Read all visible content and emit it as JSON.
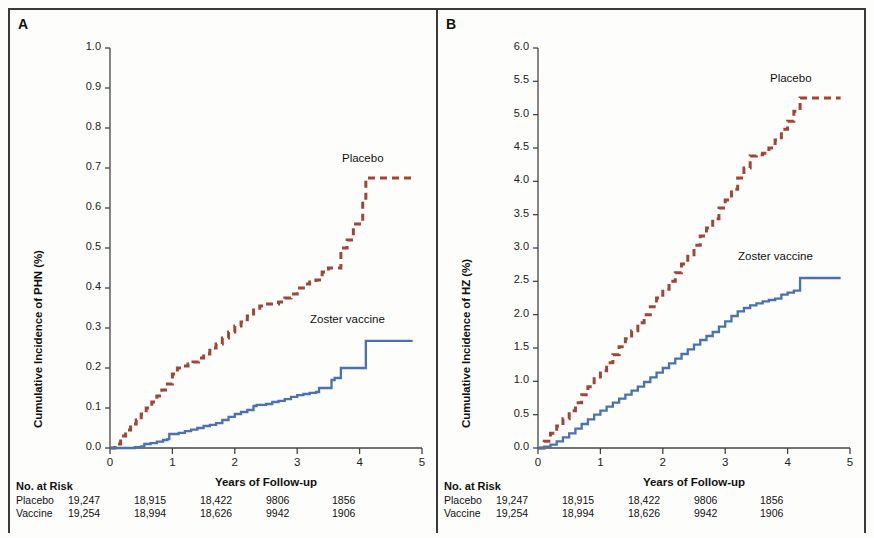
{
  "figure": {
    "background": "#fdfdfc",
    "frame_color": "#3a3a3a",
    "placebo_color": "#9e4638",
    "vaccine_color": "#4a72b0"
  },
  "panels": [
    {
      "letter": "A",
      "y_axis_title": "Cumulative Incidence of PHN (%)",
      "x_axis_title": "Years of Follow-up",
      "y_ticks": [
        "0.0",
        "0.1",
        "0.2",
        "0.3",
        "0.4",
        "0.5",
        "0.6",
        "0.7",
        "0.8",
        "0.9",
        "1.0"
      ],
      "x_ticks": [
        "0",
        "1",
        "2",
        "3",
        "4",
        "5"
      ],
      "placebo_label": "Placebo",
      "vaccine_label": "Zoster vaccine"
    },
    {
      "letter": "B",
      "y_axis_title": "Cumulative Incidence of HZ (%)",
      "x_axis_title": "Years of Follow-up",
      "y_ticks": [
        "0.0",
        "0.5",
        "1.0",
        "1.5",
        "2.0",
        "2.5",
        "3.0",
        "3.5",
        "4.0",
        "4.5",
        "5.0",
        "5.5",
        "6.0"
      ],
      "x_ticks": [
        "0",
        "1",
        "2",
        "3",
        "4",
        "5"
      ],
      "placebo_label": "Placebo",
      "vaccine_label": "Zoster vaccine"
    }
  ],
  "risk_table": {
    "title": "No. at Risk",
    "rows": [
      {
        "label": "Placebo",
        "values": [
          "19,247",
          "18,915",
          "18,422",
          "9806",
          "1856"
        ]
      },
      {
        "label": "Vaccine",
        "values": [
          "19,254",
          "18,994",
          "18,626",
          "9942",
          "1906"
        ]
      }
    ]
  },
  "chart_data": [
    {
      "type": "line",
      "panel": "A",
      "title": "Cumulative Incidence of PHN",
      "xlabel": "Years of Follow-up",
      "ylabel": "Cumulative Incidence of PHN (%)",
      "xlim": [
        0,
        5
      ],
      "ylim": [
        0,
        1.0
      ],
      "grid": false,
      "legend_position": "inline-annotation",
      "series": [
        {
          "name": "Placebo",
          "style": "dashed",
          "color": "#9e4638",
          "x": [
            0,
            0.08,
            0.17,
            0.25,
            0.33,
            0.42,
            0.5,
            0.58,
            0.67,
            0.75,
            0.83,
            0.92,
            1.0,
            1.08,
            1.17,
            1.25,
            1.33,
            1.42,
            1.5,
            1.6,
            1.7,
            1.8,
            1.9,
            2.0,
            2.1,
            2.2,
            2.3,
            2.4,
            2.5,
            2.6,
            2.7,
            2.8,
            2.9,
            3.0,
            3.1,
            3.2,
            3.3,
            3.4,
            3.5,
            3.6,
            3.7,
            3.8,
            3.9,
            4.0,
            4.05,
            4.1,
            4.85
          ],
          "y": [
            0.0,
            0.01,
            0.03,
            0.045,
            0.06,
            0.07,
            0.085,
            0.1,
            0.115,
            0.13,
            0.145,
            0.16,
            0.185,
            0.2,
            0.205,
            0.21,
            0.215,
            0.225,
            0.235,
            0.25,
            0.26,
            0.275,
            0.29,
            0.305,
            0.315,
            0.33,
            0.345,
            0.355,
            0.36,
            0.36,
            0.365,
            0.375,
            0.385,
            0.4,
            0.41,
            0.415,
            0.42,
            0.44,
            0.45,
            0.45,
            0.5,
            0.52,
            0.56,
            0.56,
            0.62,
            0.675,
            0.675
          ]
        },
        {
          "name": "Zoster vaccine",
          "style": "solid",
          "color": "#4a72b0",
          "x": [
            0,
            0.2,
            0.4,
            0.5,
            0.55,
            0.65,
            0.75,
            0.85,
            0.92,
            0.95,
            1.0,
            1.1,
            1.2,
            1.3,
            1.4,
            1.5,
            1.6,
            1.7,
            1.8,
            1.9,
            2.0,
            2.1,
            2.2,
            2.3,
            2.35,
            2.4,
            2.5,
            2.6,
            2.7,
            2.8,
            2.9,
            3.0,
            3.1,
            3.2,
            3.3,
            3.35,
            3.45,
            3.55,
            3.6,
            3.65,
            3.7,
            3.8,
            3.9,
            4.0,
            4.05,
            4.1,
            4.85
          ],
          "y": [
            0.0,
            0.0,
            0.002,
            0.004,
            0.01,
            0.012,
            0.016,
            0.02,
            0.022,
            0.035,
            0.035,
            0.038,
            0.042,
            0.046,
            0.05,
            0.055,
            0.058,
            0.062,
            0.07,
            0.078,
            0.085,
            0.09,
            0.095,
            0.105,
            0.108,
            0.108,
            0.11,
            0.115,
            0.118,
            0.122,
            0.128,
            0.132,
            0.135,
            0.138,
            0.14,
            0.15,
            0.15,
            0.17,
            0.175,
            0.175,
            0.2,
            0.2,
            0.2,
            0.2,
            0.2,
            0.268,
            0.268
          ]
        }
      ]
    },
    {
      "type": "line",
      "panel": "B",
      "title": "Cumulative Incidence of HZ",
      "xlabel": "Years of Follow-up",
      "ylabel": "Cumulative Incidence of HZ (%)",
      "xlim": [
        0,
        5
      ],
      "ylim": [
        0,
        6.0
      ],
      "grid": false,
      "legend_position": "inline-annotation",
      "series": [
        {
          "name": "Placebo",
          "style": "dashed",
          "color": "#9e4638",
          "x": [
            0,
            0.1,
            0.2,
            0.3,
            0.4,
            0.5,
            0.6,
            0.7,
            0.8,
            0.9,
            1.0,
            1.1,
            1.2,
            1.3,
            1.4,
            1.5,
            1.6,
            1.7,
            1.8,
            1.9,
            2.0,
            2.1,
            2.2,
            2.3,
            2.4,
            2.5,
            2.6,
            2.7,
            2.8,
            2.9,
            3.0,
            3.1,
            3.2,
            3.3,
            3.4,
            3.5,
            3.6,
            3.7,
            3.8,
            3.9,
            4.0,
            4.1,
            4.2,
            4.25,
            4.85
          ],
          "y": [
            0.0,
            0.1,
            0.22,
            0.33,
            0.44,
            0.56,
            0.68,
            0.8,
            0.92,
            1.04,
            1.16,
            1.28,
            1.4,
            1.52,
            1.64,
            1.76,
            1.88,
            2.0,
            2.12,
            2.25,
            2.38,
            2.5,
            2.63,
            2.76,
            2.9,
            3.04,
            3.18,
            3.3,
            3.44,
            3.6,
            3.72,
            3.88,
            4.05,
            4.2,
            4.38,
            4.4,
            4.42,
            4.5,
            4.62,
            4.78,
            4.9,
            5.05,
            5.25,
            5.25,
            5.25
          ]
        },
        {
          "name": "Zoster vaccine",
          "style": "solid",
          "color": "#4a72b0",
          "x": [
            0,
            0.1,
            0.2,
            0.3,
            0.4,
            0.5,
            0.6,
            0.7,
            0.8,
            0.9,
            1.0,
            1.1,
            1.2,
            1.3,
            1.4,
            1.5,
            1.6,
            1.7,
            1.8,
            1.9,
            2.0,
            2.1,
            2.2,
            2.3,
            2.4,
            2.5,
            2.6,
            2.7,
            2.8,
            2.9,
            3.0,
            3.1,
            3.2,
            3.3,
            3.4,
            3.5,
            3.6,
            3.7,
            3.8,
            3.9,
            4.0,
            4.1,
            4.2,
            4.25,
            4.85
          ],
          "y": [
            0.0,
            0.02,
            0.05,
            0.1,
            0.16,
            0.22,
            0.29,
            0.36,
            0.43,
            0.5,
            0.56,
            0.62,
            0.68,
            0.74,
            0.8,
            0.86,
            0.92,
            0.99,
            1.06,
            1.13,
            1.2,
            1.27,
            1.34,
            1.41,
            1.48,
            1.55,
            1.62,
            1.68,
            1.74,
            1.82,
            1.9,
            1.98,
            2.05,
            2.1,
            2.14,
            2.17,
            2.2,
            2.22,
            2.24,
            2.3,
            2.33,
            2.36,
            2.55,
            2.55,
            2.55
          ]
        }
      ]
    }
  ]
}
